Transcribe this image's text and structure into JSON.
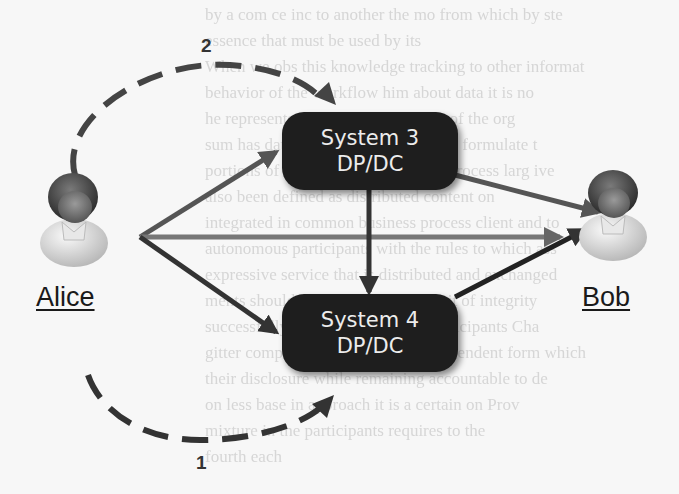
{
  "diagram": {
    "actors": [
      {
        "id": "alice",
        "label": "Alice"
      },
      {
        "id": "bob",
        "label": "Bob"
      }
    ],
    "systems": [
      {
        "id": "system3",
        "line1": "System 3",
        "line2": "DP/DC"
      },
      {
        "id": "system4",
        "line1": "System 4",
        "line2": "DP/DC"
      }
    ],
    "steps": [
      {
        "id": "step1",
        "label": "1"
      },
      {
        "id": "step2",
        "label": "2"
      }
    ],
    "edges": [
      {
        "from": "alice",
        "to": "system3",
        "style": "solid"
      },
      {
        "from": "alice",
        "to": "bob",
        "style": "solid"
      },
      {
        "from": "alice",
        "to": "system4",
        "style": "solid"
      },
      {
        "from": "system3",
        "to": "system4",
        "style": "solid"
      },
      {
        "from": "system3",
        "to": "bob",
        "style": "solid"
      },
      {
        "from": "system4",
        "to": "bob",
        "style": "solid"
      },
      {
        "from": "alice",
        "to": "system3",
        "style": "dashed",
        "label": "2"
      },
      {
        "from": "alice",
        "to": "system4",
        "style": "dashed",
        "label": "1"
      }
    ],
    "colors": {
      "box_fill": "#1e1e1e",
      "box_text": "#ececec",
      "arrow": "#444444",
      "dashed_arrow": "#3a3a3a"
    }
  }
}
